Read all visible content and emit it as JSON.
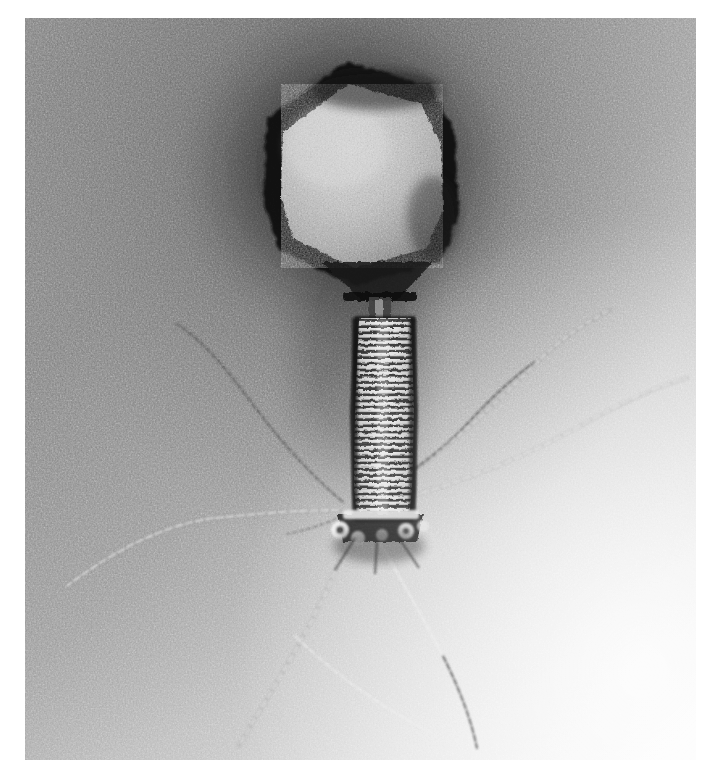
{
  "image": {
    "kind": "transmission-electron-micrograph",
    "subject": "bacteriophage",
    "morphology": "Myoviridae (T4-like) virion, negative stain",
    "width_px": 704,
    "height_px": 777,
    "plate": {
      "left_px": 25,
      "top_px": 18,
      "width_px": 671,
      "height_px": 742,
      "margin_color": "#ffffff"
    },
    "palette": {
      "background_dark": "#4a4a4a",
      "background_mid": "#8c8c8c",
      "background_light": "#e8e8e8",
      "background_highlight": "#fbfbfb",
      "stain_halo": "#1b1b1b",
      "capsid_rim": "#161616",
      "capsid_interior": "#b9b9b9",
      "tail_sheath_band": "#f2f2f2",
      "tail_sheath_groove": "#2a2a2a",
      "fiber_bright": "#f0f0f0",
      "fiber_dark": "#242424"
    },
    "lighting": {
      "description": "Diagonal illumination gradient: darkest at upper-left-of-centre, brightest toward lower-right corner",
      "dark_pole": "top-center",
      "bright_pole": "bottom-right"
    }
  },
  "structures": [
    {
      "id": "capsid",
      "label": "Icosahedral capsid (head)",
      "shape": "elongated hexagonal prolate projection",
      "center_x": 350,
      "center_y": 170,
      "width_px": 170,
      "height_px": 215,
      "rim": "dark stain-excluded border",
      "interior": "granular light protein shell"
    },
    {
      "id": "neck",
      "label": "Neck and collar",
      "center_x": 352,
      "center_y": 288,
      "width_px": 26,
      "height_px": 30
    },
    {
      "id": "tail-sheath",
      "label": "Contractile tail sheath",
      "center_x": 360,
      "top_y": 300,
      "bottom_y": 500,
      "width_px": 46,
      "striations": 32,
      "striation_period_px": 6.2,
      "note": "Helically banded sheath with alternating bright and dark transverse striations"
    },
    {
      "id": "baseplate",
      "label": "Baseplate with tail pins",
      "center_x": 355,
      "center_y": 513,
      "width_px": 86,
      "height_px": 38
    },
    {
      "id": "tail-fibers",
      "label": "Long tail fibers",
      "count": 6,
      "note": "Thin kinked filaments radiating from the baseplate; some appear bright, some dark depending on stain"
    }
  ],
  "tail_fibers": [
    {
      "name": "fiber-upper-right-1",
      "tone": "bright",
      "path": "M352,505 C420,470 470,420 520,368 C548,340 572,322 596,310"
    },
    {
      "name": "fiber-upper-right-2",
      "tone": "bright",
      "path": "M352,508 C430,490 500,462 560,428 C608,402 640,386 664,378"
    },
    {
      "name": "fiber-right-dark",
      "tone": "dark",
      "path": "M350,500 C396,480 432,452 462,420 C486,394 506,374 524,360"
    },
    {
      "name": "fiber-upper-left",
      "tone": "dark",
      "path": "M340,500 C300,468 268,430 240,392 C214,358 194,336 172,322"
    },
    {
      "name": "fiber-left",
      "tone": "bright",
      "path": "M334,508 C290,508 246,512 208,516 C160,522 110,546 60,584"
    },
    {
      "name": "fiber-lower-left",
      "tone": "bright",
      "path": "M344,528 C330,566 312,604 292,640 C268,682 248,714 232,742"
    },
    {
      "name": "fiber-lower-right",
      "tone": "mixed",
      "path": "M366,530 C390,572 414,614 434,652 C452,688 462,716 468,742"
    },
    {
      "name": "fiber-lower-center",
      "tone": "bright",
      "path": "M300,636 C340,676 382,706 424,730"
    }
  ],
  "metadata_visible": {
    "caption": "",
    "scale_bar": "none visible",
    "labels": "none visible"
  }
}
